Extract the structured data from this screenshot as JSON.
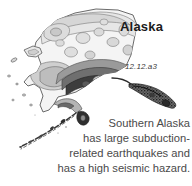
{
  "figure": {
    "title": "Alaska",
    "label": "12.12.a3",
    "caption_lines": [
      "Southern Alaska",
      "has large subduction-",
      "related earthquakes and",
      "has a high seismic hazard."
    ],
    "caption_full": "Southern Alaska has large subduction-related earthquakes and has a high seismic hazard.",
    "map": {
      "region_name": "Alaska",
      "map_type": "seismic-hazard-contour-map",
      "background_color": "#ffffff",
      "outline_color": "#555555",
      "hazard_zones": [
        {
          "name": "lowest-hazard",
          "color": "#f2f2f2"
        },
        {
          "name": "low-hazard",
          "color": "#e4e4e4"
        },
        {
          "name": "moderate-hazard",
          "color": "#cfcfcf"
        },
        {
          "name": "high-hazard",
          "color": "#a8a8a8"
        },
        {
          "name": "very-high-hazard",
          "color": "#777777"
        },
        {
          "name": "highest-hazard",
          "color": "#3d3d3d"
        }
      ],
      "features": [
        "alaska-mainland",
        "seward-peninsula",
        "southern-coast-subduction-band",
        "alaska-peninsula",
        "aleutian-island-arc",
        "kodiak-island",
        "southeast-panhandle"
      ]
    }
  }
}
